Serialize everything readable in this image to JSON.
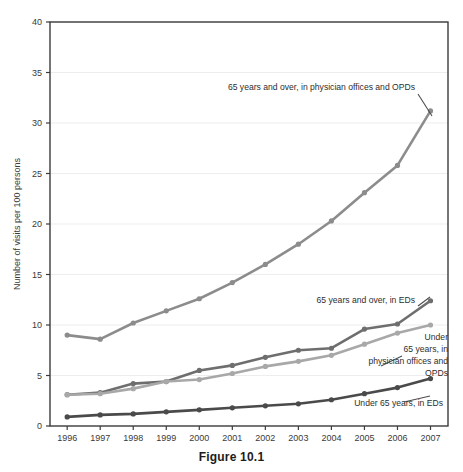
{
  "figure": {
    "caption": "Figure 10.1"
  },
  "chart_data": {
    "type": "line",
    "title": "",
    "xlabel": "",
    "ylabel": "Number of visits per 100 persons",
    "categories": [
      "1996",
      "1997",
      "1998",
      "1999",
      "2000",
      "2001",
      "2002",
      "2003",
      "2004",
      "2005",
      "2006",
      "2007"
    ],
    "x": [
      1996,
      1997,
      1998,
      1999,
      2000,
      2001,
      2002,
      2003,
      2004,
      2005,
      2006,
      2007
    ],
    "ylim": [
      0,
      40
    ],
    "yticks": [
      0,
      5,
      10,
      15,
      20,
      25,
      30,
      35,
      40
    ],
    "ytick_labels": [
      "0",
      "5",
      "10",
      "15",
      "20",
      "25",
      "30",
      "35",
      "40"
    ],
    "grid": true,
    "legend_position": "inline-annotations",
    "series": [
      {
        "name": "65 years and over, in physician offices and OPDs",
        "color": "#8c8c8c",
        "values": [
          9.0,
          8.6,
          10.2,
          11.4,
          12.6,
          14.2,
          16.0,
          18.0,
          20.3,
          23.1,
          25.8,
          31.2
        ]
      },
      {
        "name": "65 years and over, in EDs",
        "color": "#6e6e6e",
        "values": [
          3.1,
          3.3,
          4.2,
          4.4,
          5.5,
          6.0,
          6.8,
          7.5,
          7.7,
          9.6,
          10.1,
          12.4
        ]
      },
      {
        "name": "Under 65 years, in physician offices and OPDs",
        "color": "#a8a8a8",
        "values": [
          3.1,
          3.2,
          3.7,
          4.4,
          4.6,
          5.2,
          5.9,
          6.4,
          7.0,
          8.1,
          9.2,
          10.0
        ]
      },
      {
        "name": "Under 65 years, in EDs",
        "color": "#4a4a4a",
        "values": [
          0.9,
          1.1,
          1.2,
          1.4,
          1.6,
          1.8,
          2.0,
          2.2,
          2.6,
          3.2,
          3.8,
          4.7
        ]
      }
    ],
    "annotations": [
      {
        "id": "ann-65-over-offices",
        "text": "65 years and over, in physician offices and OPDs",
        "anchor": "end",
        "x": 415,
        "y": 90
      },
      {
        "id": "ann-65-over-eds",
        "text": "65 years and over, in EDs",
        "anchor": "end",
        "x": 415,
        "y": 303
      },
      {
        "id": "ann-under-65-offices-l1",
        "text": "Under",
        "anchor": "end",
        "x": 448,
        "y": 340
      },
      {
        "id": "ann-under-65-offices-l2",
        "text": "65 years, in",
        "anchor": "end",
        "x": 448,
        "y": 352
      },
      {
        "id": "ann-under-65-offices-l3",
        "text": "physician offices and",
        "anchor": "end",
        "x": 448,
        "y": 364
      },
      {
        "id": "ann-under-65-offices-l4",
        "text": "OPDs",
        "anchor": "end",
        "x": 448,
        "y": 376
      },
      {
        "id": "ann-under-65-eds",
        "text": "Under 65 years, in EDs",
        "anchor": "end",
        "x": 443,
        "y": 406
      }
    ]
  }
}
